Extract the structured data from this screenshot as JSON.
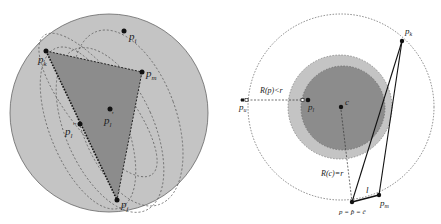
{
  "left_panel": {
    "points": {
      "p_i": "p",
      "p_i_sub": "i",
      "p_k": "p",
      "p_k_sub": "k",
      "p_m": "p",
      "p_m_sub": "m",
      "p_l_prime": "p",
      "p_l_prime_sub": "l",
      "p_l_prime_sup": "'",
      "p_l_dprime": "p",
      "p_l_dprime_sub": "l",
      "p_l_dprime_sup": "''",
      "p_j": "p",
      "p_j_sub": "j"
    },
    "colors": {
      "disk": "#c4c4c4",
      "triangle": "#8c8c8c",
      "outline": "#555555"
    }
  },
  "right_panel": {
    "labels": {
      "p_k": "p",
      "p_k_sub": "k",
      "p_u": "p",
      "p_u_sub": "u",
      "p_l": "p",
      "p_l_sub": "l",
      "c": "c",
      "R_p": "R(p)<r",
      "R_c": "R(c)=r",
      "l": "l",
      "p_m": "p",
      "p_m_sub": "m",
      "bottom": "p = p̂ = ĉ"
    },
    "colors": {
      "outer_ring": "#c4c4c4",
      "inner_disk": "#8c8c8c"
    }
  }
}
